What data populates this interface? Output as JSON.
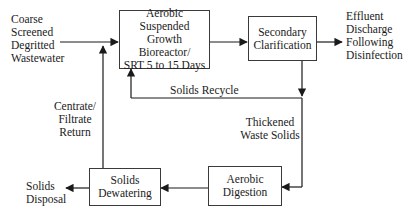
{
  "diagram": {
    "type": "process-flow",
    "colors": {
      "line": "#1a1a1a",
      "box_border": "#3a3a3a",
      "text": "#1a1a1a",
      "background": "#ffffff"
    },
    "inputs": {
      "influent": [
        "Coarse",
        "Screened",
        "Degritted",
        "Wastewater"
      ]
    },
    "boxes": {
      "bioreactor": [
        "Aerobic Suspended",
        "Growth Bioreactor/",
        "SRT 5 to 15 Days"
      ],
      "clarifier": [
        "Secondary",
        "Clarification"
      ],
      "digestion": [
        "Aerobic",
        "Digestion"
      ],
      "dewatering": [
        "Solids",
        "Dewatering"
      ]
    },
    "labels": {
      "effluent": [
        "Effluent",
        "Discharge",
        "Following",
        "Disinfection"
      ],
      "solids_recycle": "Solids Recycle",
      "thickened": [
        "Thickened",
        "Waste Solids"
      ],
      "centrate": [
        "Centrate/",
        "Filtrate",
        "Return"
      ],
      "disposal": [
        "Solids",
        "Disposal"
      ]
    },
    "edges": [
      {
        "from": "influent",
        "to": "bioreactor"
      },
      {
        "from": "bioreactor",
        "to": "clarifier"
      },
      {
        "from": "clarifier",
        "to": "effluent"
      },
      {
        "from": "clarifier",
        "to": "bioreactor",
        "label": "Solids Recycle"
      },
      {
        "from": "clarifier",
        "to": "digestion",
        "label": "Thickened Waste Solids"
      },
      {
        "from": "digestion",
        "to": "dewatering"
      },
      {
        "from": "dewatering",
        "to": "disposal"
      },
      {
        "from": "dewatering",
        "to": "bioreactor",
        "label": "Centrate/Filtrate Return"
      }
    ]
  }
}
